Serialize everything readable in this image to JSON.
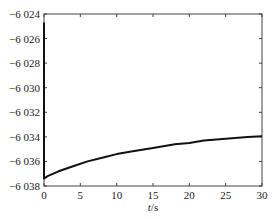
{
  "chart_data": {
    "type": "line",
    "title": "",
    "xlabel": "t/s",
    "ylabel": "",
    "xlim": [
      0,
      30
    ],
    "ylim": [
      -6038,
      -6024
    ],
    "x_ticks": [
      0,
      5,
      10,
      15,
      20,
      25,
      30
    ],
    "x_tick_labels": [
      "0",
      "5",
      "10",
      "15",
      "20",
      "25",
      "30"
    ],
    "y_ticks": [
      -6024,
      -6026,
      -6028,
      -6030,
      -6032,
      -6034,
      -6036,
      -6038
    ],
    "y_tick_labels": [
      "−6 024",
      "−6 026",
      "−6 028",
      "−6 030",
      "−6 032",
      "−6 034",
      "−6 036",
      "−6 038"
    ],
    "grid": false,
    "legend": null,
    "series": [
      {
        "name": "curve",
        "color": "#111111",
        "x": [
          0,
          0,
          0.5,
          2,
          4,
          6,
          8,
          10,
          12,
          15,
          18,
          20,
          22,
          25,
          28,
          30
        ],
        "values": [
          -6024.7,
          -6037.4,
          -6037.2,
          -6036.8,
          -6036.4,
          -6036.0,
          -6035.7,
          -6035.4,
          -6035.2,
          -6034.9,
          -6034.6,
          -6034.5,
          -6034.3,
          -6034.15,
          -6034.0,
          -6033.95
        ]
      }
    ]
  }
}
